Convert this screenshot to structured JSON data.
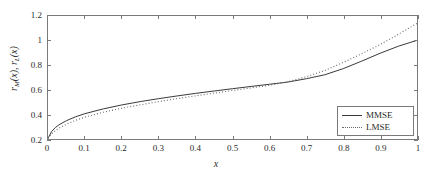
{
  "chart_data": {
    "type": "line",
    "title": "",
    "xlabel": "x",
    "ylabel": "r_M(x),  r_L(x)",
    "xlim": [
      0,
      1
    ],
    "ylim": [
      0.2,
      1.2
    ],
    "grid": false,
    "legend_position": "lower-right",
    "xticks": [
      "0",
      "0.1",
      "0.2",
      "0.3",
      "0.4",
      "0.5",
      "0.6",
      "0.7",
      "0.8",
      "0.9",
      "1"
    ],
    "xtick_values": [
      0,
      0.1,
      0.2,
      0.3,
      0.4,
      0.5,
      0.6,
      0.7,
      0.8,
      0.9,
      1
    ],
    "yticks": [
      "0.2",
      "0.4",
      "0.6",
      "0.8",
      "1",
      "1.2"
    ],
    "ytick_values": [
      0.2,
      0.4,
      0.6,
      0.8,
      1.0,
      1.2
    ],
    "x": [
      0,
      0.01,
      0.02,
      0.03,
      0.05,
      0.075,
      0.1,
      0.15,
      0.2,
      0.25,
      0.3,
      0.35,
      0.4,
      0.45,
      0.5,
      0.55,
      0.6,
      0.65,
      0.7,
      0.75,
      0.8,
      0.85,
      0.9,
      0.95,
      1.0
    ],
    "series": [
      {
        "name": "MMSE",
        "style": "solid",
        "color": "#3a3a3a",
        "values": [
          0.205,
          0.262,
          0.293,
          0.316,
          0.349,
          0.381,
          0.406,
          0.445,
          0.477,
          0.504,
          0.528,
          0.55,
          0.571,
          0.59,
          0.609,
          0.627,
          0.645,
          0.663,
          0.69,
          0.722,
          0.772,
          0.833,
          0.897,
          0.955,
          1.002
        ]
      },
      {
        "name": "LMSE",
        "style": "dotted",
        "color": "#6a6a6a",
        "values": [
          0.205,
          0.243,
          0.268,
          0.288,
          0.32,
          0.352,
          0.378,
          0.418,
          0.45,
          0.478,
          0.504,
          0.528,
          0.551,
          0.573,
          0.594,
          0.615,
          0.637,
          0.665,
          0.706,
          0.757,
          0.822,
          0.893,
          0.968,
          1.052,
          1.14
        ]
      }
    ]
  },
  "legend": {
    "entries": [
      {
        "label": "MMSE",
        "style": "solid"
      },
      {
        "label": "LMSE",
        "style": "dotted"
      }
    ]
  },
  "axis_titles": {
    "x": "x",
    "y_part1": "r",
    "y_sub1": "M",
    "y_mid": "(x),   r",
    "y_sub2": "L",
    "y_part2": "(x)"
  },
  "colors": {
    "axis": "#7a7a7a",
    "mmse": "#3a3a3a",
    "lmse": "#6a6a6a",
    "background": "#ffffff"
  }
}
